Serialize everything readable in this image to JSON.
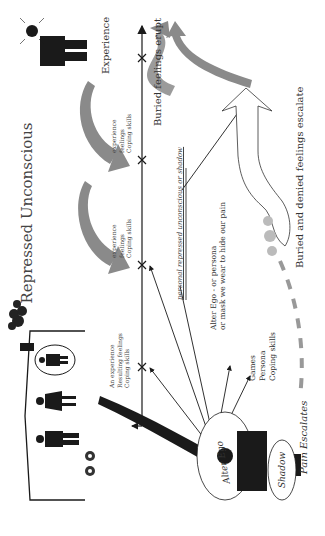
{
  "diagram": {
    "title": "Repressed Unconscious",
    "labels": {
      "experience": "Experience",
      "buried_feelings_erupt": "Buried feelings erupt",
      "buried_denied_escalate": "Buried and denied feelings escalate",
      "pain_escalates": "Pain Escalates",
      "personal_repressed": "personal repressed unconscious or shadow",
      "alter_ego_line1": "Alter Ego - or persona",
      "alter_ego_line2": "or mask we wear to hide our pain",
      "alter_ego_circle": "Alter Ego",
      "shadow": "Shadow"
    },
    "coping_list": [
      "Games",
      "Persona",
      "Coping skills"
    ],
    "timeline_stages": [
      {
        "lines": [
          "An experience",
          "Resulting feelings",
          "Coping skills"
        ]
      },
      {
        "lines": [
          "experience",
          "feelings",
          "Coping skills"
        ]
      },
      {
        "lines": [
          "experience",
          "feelings",
          "Coping skills"
        ]
      }
    ],
    "colors": {
      "ink": "#1a1a1a",
      "grey_arrow": "#8a8a8a",
      "text": "#333333"
    }
  }
}
